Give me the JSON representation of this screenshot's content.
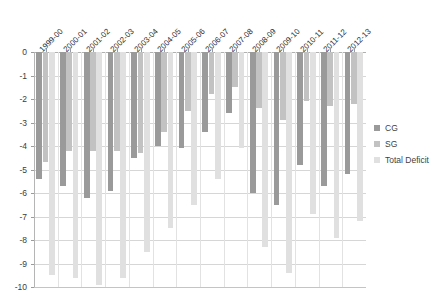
{
  "chart_data": {
    "type": "bar",
    "title": "",
    "subtitle": "",
    "xlabel": "",
    "ylabel": "",
    "ylim": [
      -10,
      0
    ],
    "ytick_labels": [
      "0",
      "-1",
      "-2",
      "-3",
      "-4",
      "-5",
      "-6",
      "-7",
      "-8",
      "-9",
      "-10"
    ],
    "ytick_values": [
      0,
      -1,
      -2,
      -3,
      -4,
      -5,
      -6,
      -7,
      -8,
      -9,
      -10
    ],
    "grid": true,
    "legend_position": "right",
    "categories": [
      "1999-00",
      "2000-01",
      "2001-02",
      "2002-03",
      "2003-04",
      "2004-05",
      "2005-06",
      "2006-07",
      "2007-08",
      "2008-09",
      "2009-10",
      "2010-11",
      "2011-12",
      "2012-13"
    ],
    "series": [
      {
        "name": "CG",
        "color": "#9a9a9a",
        "values": [
          -5.4,
          -5.7,
          -6.2,
          -5.9,
          -4.5,
          -4.0,
          -4.1,
          -3.4,
          -2.6,
          -6.0,
          -6.5,
          -4.8,
          -5.7,
          -5.2
        ]
      },
      {
        "name": "SG",
        "color": "#c2c2c2",
        "values": [
          -4.7,
          -4.2,
          -4.2,
          -4.2,
          -4.3,
          -3.4,
          -2.5,
          -1.8,
          -1.5,
          -2.4,
          -2.9,
          -2.1,
          -2.3,
          -2.2
        ]
      },
      {
        "name": "Total Deficit",
        "color": "#e0e0e0",
        "values": [
          -9.5,
          -9.6,
          -9.9,
          -9.6,
          -8.5,
          -7.5,
          -6.5,
          -5.4,
          -4.1,
          -8.3,
          -9.4,
          -6.9,
          -7.9,
          -7.2
        ]
      }
    ]
  },
  "legend": {
    "items": [
      {
        "label": "CG",
        "color": "#9a9a9a"
      },
      {
        "label": "SG",
        "color": "#c2c2c2"
      },
      {
        "label": "Total Deficit",
        "color": "#e0e0e0"
      }
    ]
  }
}
